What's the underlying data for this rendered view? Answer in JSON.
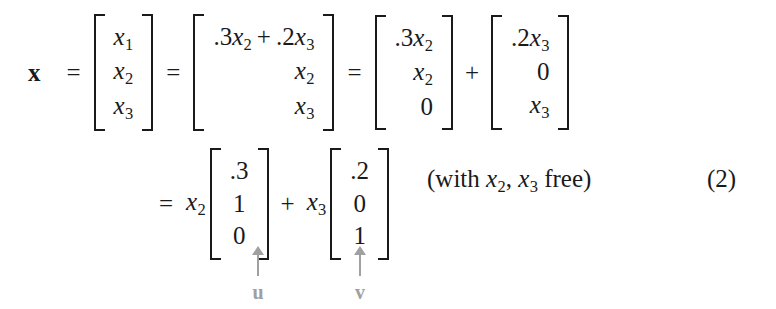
{
  "document": {
    "kind": "math-equation-display",
    "equation_number": "(2)",
    "background_color": "#ffffff",
    "text_color": "#1a1a1a",
    "annotation_color": "#a0a0a0"
  },
  "row1": {
    "lead_symbol": "x",
    "equals_1": "=",
    "equals_2": "=",
    "plus": "+",
    "matrix_x": {
      "align": "center",
      "cells": [
        {
          "base": "x",
          "sub": "1"
        },
        {
          "base": "x",
          "sub": "2"
        },
        {
          "base": "x",
          "sub": "3"
        }
      ]
    },
    "matrix_expanded": {
      "align": "right",
      "cells": [
        {
          "text": ".3x₂ + .2x₃",
          "parts": [
            {
              "num": ".3"
            },
            {
              "base": "x",
              "sub": "2"
            },
            {
              "op": "+"
            },
            {
              "num": ".2"
            },
            {
              "base": "x",
              "sub": "3"
            }
          ]
        },
        {
          "parts": [
            {
              "base": "x",
              "sub": "2"
            }
          ]
        },
        {
          "parts": [
            {
              "base": "x",
              "sub": "3"
            }
          ]
        }
      ]
    },
    "matrix_term_u": {
      "align": "right",
      "cells": [
        {
          "parts": [
            {
              "num": ".3"
            },
            {
              "base": "x",
              "sub": "2"
            }
          ]
        },
        {
          "parts": [
            {
              "base": "x",
              "sub": "2"
            }
          ]
        },
        {
          "parts": [
            {
              "num": "0"
            }
          ]
        }
      ]
    },
    "matrix_term_v": {
      "align": "right",
      "cells": [
        {
          "parts": [
            {
              "num": ".2"
            },
            {
              "base": "x",
              "sub": "3"
            }
          ]
        },
        {
          "parts": [
            {
              "num": "0"
            }
          ]
        },
        {
          "parts": [
            {
              "base": "x",
              "sub": "3"
            }
          ]
        }
      ]
    }
  },
  "row2": {
    "equals": "=",
    "plus": "+",
    "coef_1": {
      "base": "x",
      "sub": "2"
    },
    "coef_2": {
      "base": "x",
      "sub": "3"
    },
    "vector_u": {
      "align": "center",
      "values": [
        ".3",
        "1",
        "0"
      ]
    },
    "vector_v": {
      "align": "center",
      "values": [
        ".2",
        "0",
        "1"
      ]
    },
    "note": {
      "open": "(with ",
      "var_1": {
        "base": "x",
        "sub": "2"
      },
      "comma": ", ",
      "var_2": {
        "base": "x",
        "sub": "3"
      },
      "close": " free)"
    }
  },
  "annotations": [
    {
      "id": "u",
      "label": "u",
      "icon": "arrow-up-icon",
      "points_to": "vector-u"
    },
    {
      "id": "v",
      "label": "v",
      "icon": "arrow-up-icon",
      "points_to": "vector-v"
    }
  ]
}
